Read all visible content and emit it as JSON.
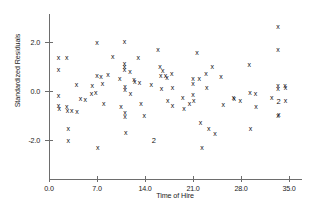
{
  "chart": {
    "title": "",
    "x_axis_title": "Time of Hire",
    "y_axis_title": "Standardized Residuals",
    "marker_glyph": "x",
    "multi_label_2": "2"
  },
  "chart_data": {
    "type": "scatter",
    "title": "",
    "xlabel": "Time of Hire",
    "ylabel": "Standardized Residuals",
    "xlim": [
      -1.0,
      37.5
    ],
    "ylim": [
      -3.6,
      3.0
    ],
    "grid": false,
    "legend": null,
    "xticks": [
      0.0,
      7.0,
      14.0,
      21.0,
      28.0,
      35.0
    ],
    "xticklabels": [
      "0.0",
      "7.0",
      "14.0",
      "21.0",
      "28.0",
      "35.0"
    ],
    "yticks": [
      2.0,
      0.0,
      -2.0
    ],
    "yticklabels": [
      "2.0",
      "0.0",
      "-2.0"
    ],
    "marker": "x",
    "points": [
      {
        "x": 1.4,
        "y": 1.35,
        "n": 1
      },
      {
        "x": 1.4,
        "y": 0.88,
        "n": 1
      },
      {
        "x": 1.4,
        "y": -0.2,
        "n": 1
      },
      {
        "x": 1.4,
        "y": -0.6,
        "n": 1
      },
      {
        "x": 1.5,
        "y": -0.72,
        "n": 1
      },
      {
        "x": 2.6,
        "y": 1.38,
        "n": 1
      },
      {
        "x": 2.6,
        "y": -0.62,
        "n": 1
      },
      {
        "x": 2.7,
        "y": -0.78,
        "n": 1
      },
      {
        "x": 2.8,
        "y": -1.53,
        "n": 1
      },
      {
        "x": 2.8,
        "y": -2.0,
        "n": 1
      },
      {
        "x": 3.3,
        "y": -0.8,
        "n": 1
      },
      {
        "x": 4.0,
        "y": 0.26,
        "n": 1
      },
      {
        "x": 4.1,
        "y": -0.82,
        "n": 1
      },
      {
        "x": 4.6,
        "y": -0.3,
        "n": 1
      },
      {
        "x": 5.3,
        "y": -0.35,
        "n": 1
      },
      {
        "x": 6.2,
        "y": -0.12,
        "n": 1
      },
      {
        "x": 6.3,
        "y": 0.23,
        "n": 1
      },
      {
        "x": 6.8,
        "y": -0.06,
        "n": 1
      },
      {
        "x": 7.0,
        "y": 1.99,
        "n": 1
      },
      {
        "x": 7.0,
        "y": 0.62,
        "n": 1
      },
      {
        "x": 7.1,
        "y": -2.3,
        "n": 1
      },
      {
        "x": 7.6,
        "y": 0.6,
        "n": 1
      },
      {
        "x": 7.8,
        "y": 0.3,
        "n": 1
      },
      {
        "x": 8.0,
        "y": -0.5,
        "n": 1
      },
      {
        "x": 8.6,
        "y": 0.66,
        "n": 1
      },
      {
        "x": 9.3,
        "y": 1.4,
        "n": 1
      },
      {
        "x": 10.3,
        "y": 0.5,
        "n": 1
      },
      {
        "x": 10.5,
        "y": -0.64,
        "n": 1
      },
      {
        "x": 11.0,
        "y": 2.02,
        "n": 1
      },
      {
        "x": 11.0,
        "y": 1.13,
        "n": 1
      },
      {
        "x": 11.0,
        "y": 1.0,
        "n": 1
      },
      {
        "x": 11.0,
        "y": 0.88,
        "n": 1
      },
      {
        "x": 11.1,
        "y": 0.18,
        "n": 1
      },
      {
        "x": 11.1,
        "y": 0.05,
        "n": 1
      },
      {
        "x": 11.1,
        "y": -0.88,
        "n": 1
      },
      {
        "x": 11.1,
        "y": -1.05,
        "n": 1
      },
      {
        "x": 11.2,
        "y": -1.7,
        "n": 1
      },
      {
        "x": 11.8,
        "y": 0.8,
        "n": 1
      },
      {
        "x": 11.9,
        "y": -0.12,
        "n": 1
      },
      {
        "x": 12.4,
        "y": 0.47,
        "n": 1
      },
      {
        "x": 12.5,
        "y": 0.4,
        "n": 1
      },
      {
        "x": 13.0,
        "y": 1.38,
        "n": 1
      },
      {
        "x": 13.2,
        "y": 0.35,
        "n": 1
      },
      {
        "x": 13.4,
        "y": -0.52,
        "n": 1
      },
      {
        "x": 13.9,
        "y": -1.02,
        "n": 1
      },
      {
        "x": 14.9,
        "y": 0.25,
        "n": 1
      },
      {
        "x": 15.3,
        "y": -2.0,
        "n": 2
      },
      {
        "x": 15.9,
        "y": 1.68,
        "n": 1
      },
      {
        "x": 16.2,
        "y": 1.0,
        "n": 1
      },
      {
        "x": 16.3,
        "y": 0.65,
        "n": 1
      },
      {
        "x": 16.4,
        "y": 0.1,
        "n": 1
      },
      {
        "x": 16.6,
        "y": 0.85,
        "n": 1
      },
      {
        "x": 17.0,
        "y": 0.62,
        "n": 1
      },
      {
        "x": 17.2,
        "y": 0.55,
        "n": 1
      },
      {
        "x": 17.3,
        "y": -0.38,
        "n": 1
      },
      {
        "x": 17.9,
        "y": 0.72,
        "n": 1
      },
      {
        "x": 18.0,
        "y": 0.13,
        "n": 1
      },
      {
        "x": 18.0,
        "y": -0.6,
        "n": 1
      },
      {
        "x": 19.5,
        "y": -0.26,
        "n": 1
      },
      {
        "x": 19.7,
        "y": -0.7,
        "n": 1
      },
      {
        "x": 20.5,
        "y": -0.52,
        "n": 1
      },
      {
        "x": 21.0,
        "y": 0.52,
        "n": 1
      },
      {
        "x": 21.0,
        "y": 0.3,
        "n": 1
      },
      {
        "x": 21.0,
        "y": -0.15,
        "n": 1
      },
      {
        "x": 21.1,
        "y": -0.38,
        "n": 1
      },
      {
        "x": 21.6,
        "y": 1.58,
        "n": 1
      },
      {
        "x": 21.9,
        "y": 0.52,
        "n": 1
      },
      {
        "x": 22.1,
        "y": -1.28,
        "n": 1
      },
      {
        "x": 22.3,
        "y": -2.3,
        "n": 1
      },
      {
        "x": 22.9,
        "y": 0.7,
        "n": 1
      },
      {
        "x": 23.0,
        "y": 0.13,
        "n": 1
      },
      {
        "x": 23.3,
        "y": -1.55,
        "n": 1
      },
      {
        "x": 23.8,
        "y": 0.98,
        "n": 1
      },
      {
        "x": 24.2,
        "y": -1.75,
        "n": 1
      },
      {
        "x": 25.1,
        "y": 0.6,
        "n": 1
      },
      {
        "x": 25.4,
        "y": -0.55,
        "n": 1
      },
      {
        "x": 26.9,
        "y": -0.28,
        "n": 1
      },
      {
        "x": 27.0,
        "y": -0.32,
        "n": 1
      },
      {
        "x": 27.9,
        "y": -0.38,
        "n": 1
      },
      {
        "x": 29.2,
        "y": 1.08,
        "n": 1
      },
      {
        "x": 29.3,
        "y": -0.08,
        "n": 1
      },
      {
        "x": 29.4,
        "y": -1.55,
        "n": 1
      },
      {
        "x": 30.1,
        "y": -0.1,
        "n": 1
      },
      {
        "x": 30.2,
        "y": -0.62,
        "n": 1
      },
      {
        "x": 32.5,
        "y": -0.28,
        "n": 1
      },
      {
        "x": 33.4,
        "y": 2.62,
        "n": 1
      },
      {
        "x": 33.4,
        "y": 1.7,
        "n": 1
      },
      {
        "x": 33.4,
        "y": 0.22,
        "n": 1
      },
      {
        "x": 33.4,
        "y": 0.1,
        "n": 1
      },
      {
        "x": 33.4,
        "y": -1.0,
        "n": 1
      },
      {
        "x": 33.5,
        "y": -0.95,
        "n": 1
      },
      {
        "x": 33.5,
        "y": -0.42,
        "n": 2
      },
      {
        "x": 34.4,
        "y": 0.22,
        "n": 1
      },
      {
        "x": 34.5,
        "y": 0.15,
        "n": 1
      },
      {
        "x": 34.5,
        "y": -0.4,
        "n": 1
      }
    ]
  }
}
